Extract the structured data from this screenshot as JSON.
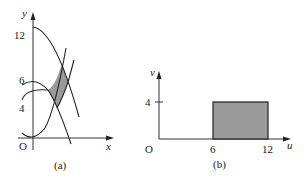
{
  "panel_a": {
    "caption": "(a)",
    "x_label": "x",
    "y_label": "y",
    "origin_label": "O",
    "y_ticks": [
      "12",
      "6",
      "4"
    ],
    "description": "Region in the xy-plane bounded by four curves (two pairs of parabola-like curves), shaded gray"
  },
  "panel_b": {
    "caption": "(b)",
    "x_label": "u",
    "y_label": "v",
    "origin_label": "O",
    "x_ticks": [
      "6",
      "12"
    ],
    "y_ticks": [
      "4"
    ],
    "rectangle": {
      "u_min": 6,
      "u_max": 12,
      "v_min": 0,
      "v_max": 4
    },
    "description": "Rectangle 6 ≤ u ≤ 12, 0 ≤ v ≤ 4 in the uv-plane, shaded gray"
  },
  "colors": {
    "shade": "#9a9a9a",
    "line": "#222222"
  }
}
